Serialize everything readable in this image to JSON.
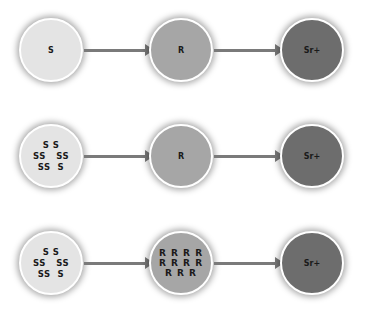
{
  "rows": [
    {
      "nodes": [
        {
          "label": "S",
          "fill": "#e4e4e4"
        },
        {
          "label": "R",
          "fill": "#a6a6a6"
        },
        {
          "label": "Sr+",
          "fill": "#6d6d6d"
        }
      ]
    },
    {
      "nodes": [
        {
          "lines": [
            "S S",
            "SS   SS",
            "SS  S"
          ],
          "fill": "#e4e4e4"
        },
        {
          "label": "R",
          "fill": "#a6a6a6"
        },
        {
          "label": "Sr+",
          "fill": "#6d6d6d"
        }
      ]
    },
    {
      "nodes": [
        {
          "lines": [
            "S S",
            "SS   SS",
            "SS  S"
          ],
          "fill": "#e4e4e4"
        },
        {
          "lines": [
            "R R R R",
            "R R R R",
            "R R R"
          ],
          "fill": "#a6a6a6"
        },
        {
          "label": "Sr+",
          "fill": "#6d6d6d"
        }
      ]
    }
  ],
  "colors": {
    "arrow": "#7a7a7a",
    "border": "#ffffff"
  }
}
